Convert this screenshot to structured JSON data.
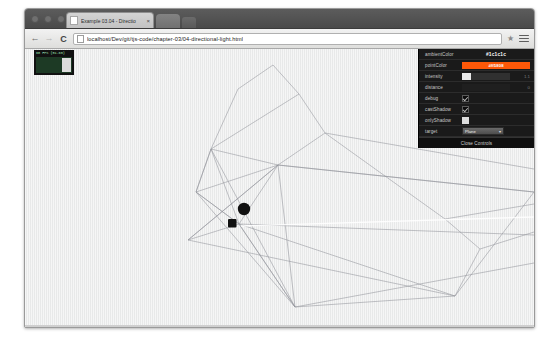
{
  "browser": {
    "tab": {
      "title": "Example 03.04 - Directio",
      "close_label": "×",
      "favicon": "page-icon"
    },
    "nav": {
      "back": "←",
      "forward": "→",
      "reload": "C"
    },
    "omnibox": {
      "url": "localhost/Dev/git/tjs-code/chapter-03/04-directional-light.html",
      "placeholder": "Search Google or type URL",
      "page_icon": "page-icon",
      "star_icon": "★"
    },
    "menu_icon": "hamburger-menu-icon"
  },
  "stats": {
    "label": "60 FPS (51-60)"
  },
  "gui": {
    "rows": [
      {
        "name": "ambientColor",
        "type": "color-text",
        "value": "#1c1c1c"
      },
      {
        "name": "pointColor",
        "type": "color-swatch",
        "value": "#ff5808",
        "swatch": "#ff5808"
      },
      {
        "name": "intensity",
        "type": "slider",
        "value": "1.1",
        "fill_percent": 18
      },
      {
        "name": "distance",
        "type": "slider-number",
        "value": "0",
        "fill_percent": 0
      },
      {
        "name": "debug",
        "type": "checkbox",
        "checked": true
      },
      {
        "name": "castShadow",
        "type": "checkbox",
        "checked": true
      },
      {
        "name": "onlyShadow",
        "type": "checkbox-filled",
        "checked": true
      },
      {
        "name": "target",
        "type": "select",
        "value": "Plane",
        "caret": "▾"
      }
    ],
    "close_label": "Close Controls",
    "panel_bg": "#1a1a1a",
    "accent": "#ff5808"
  },
  "scene": {
    "background": "#eceded",
    "wire_color": "#8d9096",
    "objects": [
      {
        "name": "sphere",
        "color": "#111111"
      },
      {
        "name": "cube",
        "color": "#111111"
      }
    ]
  }
}
